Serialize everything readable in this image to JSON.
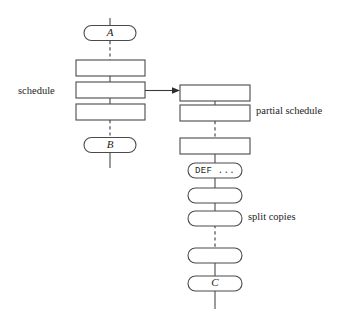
{
  "diagram": {
    "canvas": {
      "width": 354,
      "height": 321,
      "background": "#ffffff"
    },
    "stroke_color": "#4a4a4a",
    "text_color": "#1d1d1d",
    "annotations": [
      {
        "id": "schedule",
        "label": "schedule",
        "x": 18,
        "y": 86
      },
      {
        "id": "partial-schedule",
        "label": "partial schedule",
        "x": 256,
        "y": 106
      },
      {
        "id": "split-copies",
        "label": "split copies",
        "x": 248,
        "y": 212
      }
    ],
    "left_column": {
      "axis_x": 110,
      "nodes": [
        {
          "id": "node-a",
          "shape": "oval",
          "label": "A",
          "label_style": "italic",
          "cx": 110,
          "cy": 33,
          "w": 52,
          "h": 15
        },
        {
          "id": "left-rect-1",
          "shape": "rect",
          "label": "",
          "x": 76,
          "y": 60,
          "w": 69,
          "h": 16
        },
        {
          "id": "left-rect-2",
          "shape": "rect",
          "label": "",
          "x": 76,
          "y": 82,
          "w": 69,
          "h": 16
        },
        {
          "id": "left-rect-3",
          "shape": "rect",
          "label": "",
          "x": 76,
          "y": 104,
          "w": 69,
          "h": 16
        },
        {
          "id": "node-b",
          "shape": "oval",
          "label": "B",
          "label_style": "italic",
          "cx": 110,
          "cy": 145,
          "w": 52,
          "h": 15
        }
      ],
      "connectors": [
        {
          "id": "conn-top-stub",
          "style": "solid",
          "x1": 110,
          "y1": 18,
          "x2": 110,
          "y2": 26
        },
        {
          "id": "conn-a-to-rect1",
          "style": "dashed",
          "x1": 110,
          "y1": 41,
          "x2": 110,
          "y2": 60
        },
        {
          "id": "conn-rect1-rect2",
          "style": "solid",
          "x1": 110,
          "y1": 76,
          "x2": 110,
          "y2": 82
        },
        {
          "id": "conn-rect2-rect3",
          "style": "solid",
          "x1": 110,
          "y1": 98,
          "x2": 110,
          "y2": 104
        },
        {
          "id": "conn-rect3-to-b",
          "style": "dashed",
          "x1": 110,
          "y1": 120,
          "x2": 110,
          "y2": 138
        },
        {
          "id": "conn-bottom-stub",
          "style": "solid",
          "x1": 110,
          "y1": 153,
          "x2": 110,
          "y2": 168
        }
      ]
    },
    "right_column": {
      "axis_x": 215,
      "nodes": [
        {
          "id": "right-rect-1",
          "shape": "rect",
          "label": "",
          "x": 180,
          "y": 85,
          "w": 70,
          "h": 16
        },
        {
          "id": "right-rect-2",
          "shape": "rect",
          "label": "",
          "x": 180,
          "y": 105,
          "w": 70,
          "h": 16
        },
        {
          "id": "right-rect-3",
          "shape": "rect",
          "label": "",
          "x": 180,
          "y": 138,
          "w": 70,
          "h": 16
        },
        {
          "id": "node-def",
          "shape": "oval",
          "label": "DEF  ...",
          "label_style": "mono",
          "cx": 215,
          "cy": 170,
          "w": 54,
          "h": 15
        },
        {
          "id": "split-copy-1",
          "shape": "oval",
          "label": "",
          "cx": 215,
          "cy": 195,
          "w": 54,
          "h": 15
        },
        {
          "id": "split-copy-2",
          "shape": "oval",
          "label": "",
          "cx": 215,
          "cy": 218,
          "w": 54,
          "h": 15
        },
        {
          "id": "split-copy-3",
          "shape": "oval",
          "label": "",
          "cx": 215,
          "cy": 255,
          "w": 54,
          "h": 15
        },
        {
          "id": "node-c",
          "shape": "oval",
          "label": "C",
          "label_style": "italic",
          "cx": 215,
          "cy": 283,
          "w": 54,
          "h": 15
        }
      ],
      "connectors": [
        {
          "id": "conn-r1-r2",
          "style": "solid",
          "x1": 215,
          "y1": 101,
          "x2": 215,
          "y2": 105
        },
        {
          "id": "conn-r2-r3",
          "style": "dashed",
          "x1": 215,
          "y1": 121,
          "x2": 215,
          "y2": 138
        },
        {
          "id": "conn-r3-def",
          "style": "solid",
          "x1": 215,
          "y1": 154,
          "x2": 215,
          "y2": 163
        },
        {
          "id": "conn-def-sc1",
          "style": "solid",
          "x1": 215,
          "y1": 177,
          "x2": 215,
          "y2": 188
        },
        {
          "id": "conn-sc1-sc2",
          "style": "solid",
          "x1": 215,
          "y1": 202,
          "x2": 215,
          "y2": 211
        },
        {
          "id": "conn-sc2-sc3",
          "style": "dashed",
          "x1": 215,
          "y1": 225,
          "x2": 215,
          "y2": 248
        },
        {
          "id": "conn-sc3-c",
          "style": "solid",
          "x1": 215,
          "y1": 262,
          "x2": 215,
          "y2": 276
        },
        {
          "id": "conn-bottom-stub-right",
          "style": "solid",
          "x1": 215,
          "y1": 290,
          "x2": 215,
          "y2": 308
        }
      ]
    },
    "arrow": {
      "id": "schedule-to-partial-arrow",
      "x1": 145,
      "y1": 91,
      "x2": 180,
      "y2": 91
    }
  }
}
